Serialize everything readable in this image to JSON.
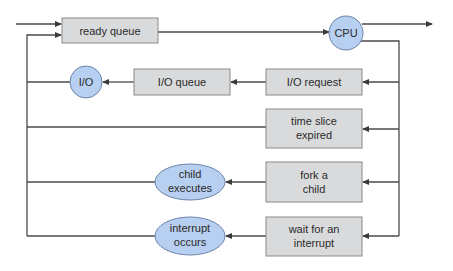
{
  "diagram": {
    "colors": {
      "box_fill": "#d9dadc",
      "box_stroke": "#8a8a8a",
      "circle_fill": "#b7cff0",
      "circle_stroke": "#6b84a8",
      "line": "#4a4a4a",
      "text": "#2a2a2a"
    },
    "queues": {
      "ready_queue": "ready queue",
      "io_queue": "I/O queue"
    },
    "resources": {
      "cpu": "CPU",
      "io": "I/O"
    },
    "events": {
      "io_request": "I/O request",
      "time_slice_line1": "time slice",
      "time_slice_line2": "expired",
      "fork_line1": "fork a",
      "fork_line2": "child",
      "wait_line1": "wait for an",
      "wait_line2": "interrupt"
    },
    "outcomes": {
      "child_line1": "child",
      "child_line2": "executes",
      "interrupt_line1": "interrupt",
      "interrupt_line2": "occurs"
    }
  }
}
